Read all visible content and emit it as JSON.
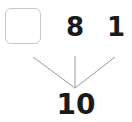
{
  "diagram": {
    "type": "number-bond",
    "parts": [
      {
        "value": "",
        "kind": "blank-box"
      },
      {
        "value": "8"
      },
      {
        "value": "1"
      }
    ],
    "whole": "10"
  },
  "colors": {
    "text": "#1a1a1a",
    "lines": "#9a9a9a",
    "box_border": "#c8c8c8"
  }
}
